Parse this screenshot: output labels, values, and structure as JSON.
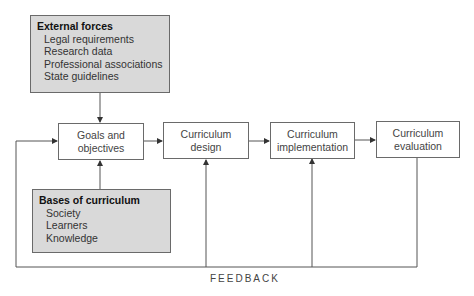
{
  "external_forces": {
    "title": "External forces",
    "items": [
      "Legal requirements",
      "Research data",
      "Professional associations",
      "State guidelines"
    ]
  },
  "bases_of_curriculum": {
    "title": "Bases of curriculum",
    "items": [
      "Society",
      "Learners",
      "Knowledge"
    ]
  },
  "stages": [
    {
      "line1": "Goals and",
      "line2": "objectives"
    },
    {
      "line1": "Curriculum",
      "line2": "design"
    },
    {
      "line1": "Curriculum",
      "line2": "implementation"
    },
    {
      "line1": "Curriculum",
      "line2": "evaluation"
    }
  ],
  "feedback_label": "FEEDBACK",
  "colors": {
    "box_fill": "#d9d9d9",
    "border": "#6a6a6a",
    "line": "#444444"
  }
}
